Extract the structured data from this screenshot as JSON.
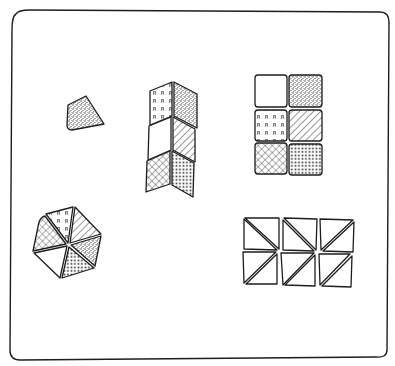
{
  "figure": {
    "frame": {
      "x": 12,
      "y": 10,
      "width": 376,
      "height": 348
    },
    "colors": {
      "ink": "#1e1e1e",
      "paper": "#ffffff"
    },
    "patterns": [
      "blank",
      "stipple",
      "letter-R",
      "diagonal-hatch",
      "crosshatch",
      "dots-grid"
    ],
    "letter_pattern_glyph": "R",
    "groups": [
      {
        "id": "kite",
        "label": "single kite-shaped tile",
        "pattern": "stipple",
        "tiles": 1
      },
      {
        "id": "chevron-stack",
        "label": "stack of rhombus tiles in chevron arrangement",
        "tiles": 6,
        "patterns": [
          "letter-R",
          "stipple",
          "blank",
          "diagonal-hatch",
          "crosshatch",
          "dots-grid"
        ]
      },
      {
        "id": "square-grid",
        "label": "3x2 grid of square tiles",
        "tiles": 6,
        "patterns": [
          "blank",
          "stipple",
          "letter-R",
          "diagonal-hatch",
          "crosshatch",
          "dots-grid"
        ]
      },
      {
        "id": "hexagon",
        "label": "hexagon of six triangular tiles",
        "tiles": 6,
        "patterns": [
          "letter-R",
          "diagonal-hatch",
          "stipple",
          "dots-grid",
          "blank",
          "crosshatch"
        ]
      },
      {
        "id": "triangle-grid",
        "label": "2x3 grid of squares split into triangles",
        "tiles": 12,
        "pattern": "blank"
      }
    ]
  }
}
